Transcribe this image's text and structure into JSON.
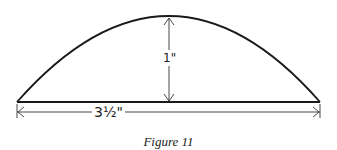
{
  "figure": {
    "caption": "Figure 11",
    "shape": "circular-segment-arc",
    "dimensions": {
      "width_label": "3½\"",
      "height_label": "1\""
    },
    "colors": {
      "stroke": "#1a1a1a",
      "background": "#ffffff"
    }
  }
}
